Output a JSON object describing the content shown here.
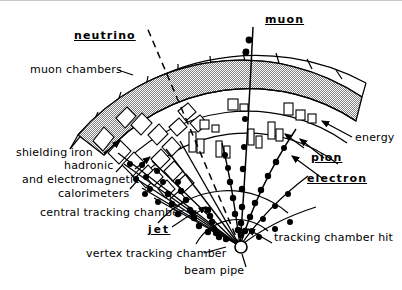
{
  "figure": {
    "background_color": "#ffffff",
    "line_color": "#000000",
    "shielding_fill": "#b4b4b4"
  },
  "labels": {
    "neutrino": "neutrino",
    "muon": "muon",
    "muon_chambers": "muon chambers",
    "energy": "energy",
    "pion": "pion",
    "electron": "electron",
    "shielding_iron": "shielding iron",
    "hadronic": "hadronic",
    "and_electromagnetic": "and electromagnetic",
    "calorimeters": "calorimeters",
    "central_tracking_chamber": "central tracking chamber",
    "jet": "jet",
    "vertex_tracking_chamber": "vertex tracking chamber",
    "beam_pipe": "beam pipe",
    "tracking_chamber_hit": "tracking chamber hit"
  },
  "components": [
    {
      "name": "muon-chambers",
      "label": "muon chambers",
      "kind": "segmented-arc"
    },
    {
      "name": "shielding-iron",
      "label": "shielding iron",
      "kind": "filled-arc-band"
    },
    {
      "name": "hadronic-calorimeter",
      "label": "hadronic calorimeter",
      "kind": "arc"
    },
    {
      "name": "electromagnetic-calorimeter",
      "label": "electromagnetic calorimeter",
      "kind": "arc"
    },
    {
      "name": "central-tracking-chamber",
      "label": "central tracking chamber",
      "kind": "arc"
    },
    {
      "name": "vertex-tracking-chamber",
      "label": "vertex tracking chamber",
      "kind": "arc"
    },
    {
      "name": "beam-pipe",
      "label": "beam pipe",
      "kind": "circle"
    }
  ],
  "particles": [
    {
      "name": "neutrino",
      "label": "neutrino",
      "style": "dashed",
      "leaves_detector": true,
      "hits": 0
    },
    {
      "name": "muon",
      "label": "muon",
      "style": "solid",
      "leaves_detector": true,
      "hits": 12
    },
    {
      "name": "pion",
      "label": "pion",
      "style": "solid-curved",
      "leaves_detector": false,
      "hits": 9
    },
    {
      "name": "electron",
      "label": "electron",
      "style": "solid-curved",
      "leaves_detector": false,
      "hits": 8
    },
    {
      "name": "jet",
      "label": "jet",
      "style": "bundle",
      "leaves_detector": false,
      "hits": 30
    }
  ]
}
